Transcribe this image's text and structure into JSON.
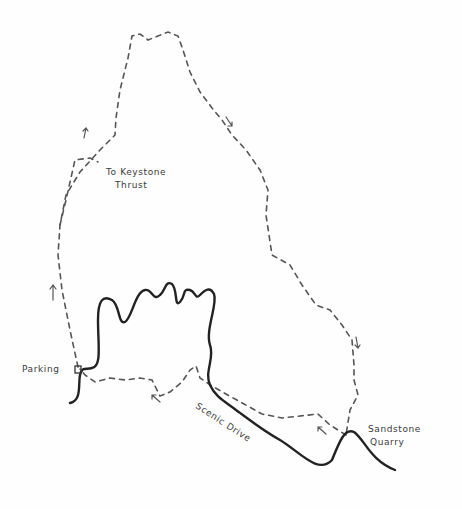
{
  "map": {
    "type": "hand-drawn trail map",
    "colors": {
      "background": "#fefefe",
      "trail": "#555555",
      "road": "#222222",
      "text": "#3a3a3a"
    },
    "labels": {
      "keystone_line1": "To Keystone",
      "keystone_line2": "Thrust",
      "parking": "Parking",
      "scenic_drive": "Scenic Drive",
      "quarry_line1": "Sandstone",
      "quarry_line2": "Quarry"
    },
    "features": {
      "trail": "dashed loop trail",
      "road": "Scenic Drive (solid line)",
      "parking_symbol": "square",
      "direction_arrows": 5
    }
  }
}
